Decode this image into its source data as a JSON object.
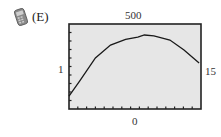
{
  "option": {
    "label": "(E)",
    "icon": "calculator-icon"
  },
  "chart_data": {
    "type": "line",
    "title": "",
    "xlabel": "",
    "ylabel": "",
    "xlim": [
      1,
      15
    ],
    "ylim": [
      0,
      500
    ],
    "window_labels": {
      "top": "500",
      "bottom": "0",
      "left": "1",
      "right": "15"
    },
    "x_ticks_count": 15,
    "y_ticks_count": 10,
    "grid": false,
    "legend": null,
    "background": "#e6e6e6",
    "frame_color": "#222222",
    "line_color": "#1a1a1a",
    "series": [
      {
        "name": "curve",
        "x": [
          1,
          2.2,
          3.8,
          5.4,
          7,
          8.3,
          9,
          10,
          11.7,
          13.2,
          14.8
        ],
        "y": [
          76,
          170,
          300,
          376,
          410,
          423,
          435,
          430,
          406,
          347,
          270
        ]
      }
    ]
  }
}
